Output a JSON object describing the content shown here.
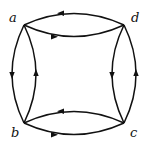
{
  "diagram": {
    "type": "directed-multigraph",
    "vertices": [
      {
        "id": "a",
        "label": "a",
        "x": 24,
        "y": 25
      },
      {
        "id": "d",
        "label": "d",
        "x": 124,
        "y": 25
      },
      {
        "id": "b",
        "label": "b",
        "x": 24,
        "y": 123
      },
      {
        "id": "c",
        "label": "c",
        "x": 124,
        "y": 123
      }
    ],
    "edges": [
      {
        "from": "d",
        "to": "a",
        "side": "top",
        "curve": "outer"
      },
      {
        "from": "a",
        "to": "d",
        "side": "top",
        "curve": "inner"
      },
      {
        "from": "a",
        "to": "b",
        "side": "left",
        "curve": "outer"
      },
      {
        "from": "b",
        "to": "a",
        "side": "left",
        "curve": "inner"
      },
      {
        "from": "b",
        "to": "c",
        "side": "bottom",
        "curve": "outer"
      },
      {
        "from": "c",
        "to": "b",
        "side": "bottom",
        "curve": "inner"
      },
      {
        "from": "c",
        "to": "d",
        "side": "right",
        "curve": "outer"
      },
      {
        "from": "d",
        "to": "c",
        "side": "right",
        "curve": "inner"
      }
    ],
    "labels": {
      "a": "a",
      "b": "b",
      "c": "c",
      "d": "d"
    },
    "stroke_color": "#111111"
  }
}
